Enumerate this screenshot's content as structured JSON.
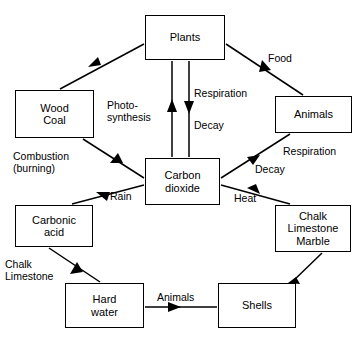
{
  "diagram": {
    "stroke_color": "#000000",
    "background_color": "#ffffff",
    "nodes": [
      {
        "id": "plants",
        "label": "Plants",
        "x": 145,
        "y": 15,
        "w": 80,
        "h": 45
      },
      {
        "id": "wood",
        "label": "Wood\nCoal",
        "x": 15,
        "y": 90,
        "w": 79,
        "h": 48
      },
      {
        "id": "animals",
        "label": "Animals",
        "x": 275,
        "y": 96,
        "w": 77,
        "h": 37
      },
      {
        "id": "co2",
        "label": "Carbon\ndioxide",
        "x": 145,
        "y": 158,
        "w": 75,
        "h": 47
      },
      {
        "id": "carbonic",
        "label": "Carbonic\nacid",
        "x": 15,
        "y": 205,
        "w": 78,
        "h": 42
      },
      {
        "id": "chalk",
        "label": "Chalk\nLimestone\nMarble",
        "x": 275,
        "y": 205,
        "w": 76,
        "h": 47
      },
      {
        "id": "hard",
        "label": "Hard\nwater",
        "x": 65,
        "y": 283,
        "w": 79,
        "h": 45
      },
      {
        "id": "shells",
        "label": "Shells",
        "x": 218,
        "y": 283,
        "w": 78,
        "h": 45
      }
    ],
    "edges": [
      {
        "id": "plants-to-wood",
        "from": "plants",
        "to": "wood",
        "label": ""
      },
      {
        "id": "plants-to-animals",
        "from": "plants",
        "to": "animals",
        "label": "Food"
      },
      {
        "id": "co2-to-plants",
        "from": "co2",
        "to": "plants",
        "label": "Photo-\nsynthesis"
      },
      {
        "id": "plants-to-co2",
        "from": "plants",
        "to": "co2",
        "label": "Respiration\nDecay"
      },
      {
        "id": "wood-to-co2",
        "from": "wood",
        "to": "co2",
        "label": "Combustion\n(burning)"
      },
      {
        "id": "co2-to-carbonic",
        "from": "co2",
        "to": "carbonic",
        "label": "Rain"
      },
      {
        "id": "animals-to-co2",
        "from": "animals",
        "to": "co2",
        "label": "Respiration\nDecay"
      },
      {
        "id": "chalk-to-co2",
        "from": "chalk",
        "to": "co2",
        "label": "Heat"
      },
      {
        "id": "carbonic-to-hard",
        "from": "carbonic",
        "to": "hard",
        "label": "Chalk\nLimestone"
      },
      {
        "id": "hard-to-shells",
        "from": "hard",
        "to": "shells",
        "label": "Animals"
      },
      {
        "id": "shells-to-chalk",
        "from": "shells",
        "to": "chalk",
        "label": ""
      }
    ],
    "labels": {
      "food": "Food",
      "photosynthesis": "Photo-\nsynthesis",
      "respiration_top": "Respiration",
      "decay_top": "Decay",
      "combustion": "Combustion\n(burning)",
      "rain": "Rain",
      "respiration_right": "Respiration",
      "decay_right": "Decay",
      "heat": "Heat",
      "chalk_limestone": "Chalk\nLimestone",
      "animals_edge": "Animals"
    }
  }
}
